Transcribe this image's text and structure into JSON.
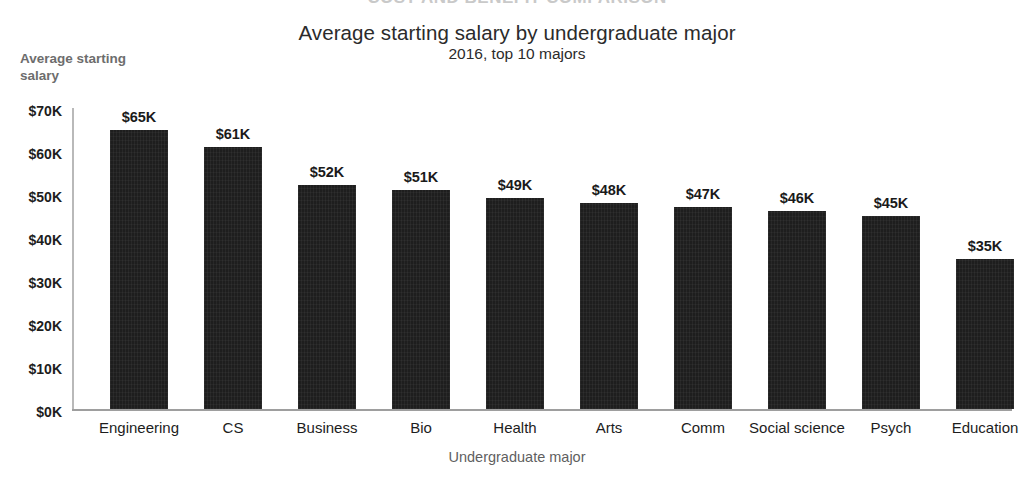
{
  "page": {
    "header_remnant": "COST AND BENEFIT COMPARISON"
  },
  "chart_data": {
    "type": "bar",
    "title": "Average starting salary by undergraduate major",
    "subtitle": "2016, top 10 majors",
    "xlabel": "Undergraduate major",
    "ylabel": "Average starting salary",
    "categories": [
      "Engineering",
      "CS",
      "Business",
      "Bio",
      "Health",
      "Arts",
      "Comm",
      "Social science",
      "Psych",
      "Education"
    ],
    "values": [
      65000,
      61000,
      52000,
      51000,
      49000,
      48000,
      47000,
      46000,
      45000,
      35000
    ],
    "value_labels": [
      "$65K",
      "$61K",
      "$52K",
      "$51K",
      "$49K",
      "$48K",
      "$47K",
      "$46K",
      "$45K",
      "$35K"
    ],
    "ylim": [
      0,
      70000
    ],
    "ytick_values": [
      0,
      10000,
      20000,
      30000,
      40000,
      50000,
      60000,
      70000
    ],
    "ytick_labels": [
      "$0K",
      "$10K",
      "$20K",
      "$30K",
      "$40K",
      "$50K",
      "$60K",
      "$70K"
    ],
    "grid": false,
    "legend": "none",
    "bar_color": "#1e1e1e",
    "axis_color": "#9e9e9e",
    "text_color": "#1d1d1d",
    "muted_text_color": "#6d6d6d"
  }
}
